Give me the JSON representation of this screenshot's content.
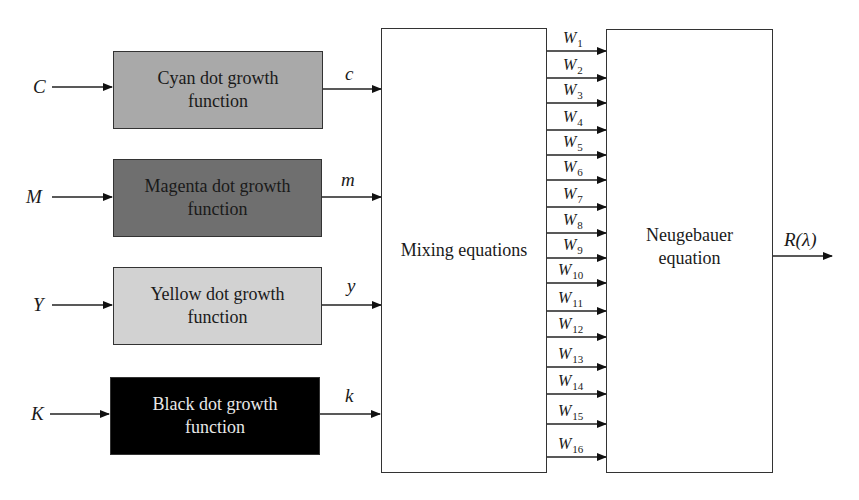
{
  "diagram": {
    "inputs": [
      {
        "label": "C",
        "block": "Cyan dot growth function",
        "output": "c",
        "fill": "#a9a9a9",
        "text_color": "#1a1a1a"
      },
      {
        "label": "M",
        "block": "Magenta dot growth function",
        "output": "m",
        "fill": "#6f6f6f",
        "text_color": "#1a1a1a"
      },
      {
        "label": "Y",
        "block": "Yellow dot growth function",
        "output": "y",
        "fill": "#d2d2d2",
        "text_color": "#1a1a1a"
      },
      {
        "label": "K",
        "block": "Black dot growth function",
        "output": "k",
        "fill": "#000000",
        "text_color": "#e8e8e8"
      }
    ],
    "mixing_block": "Mixing equations",
    "weights": {
      "symbol": "W",
      "subscripts": [
        "1",
        "2",
        "3",
        "4",
        "5",
        "6",
        "7",
        "8",
        "9",
        "10",
        "11",
        "12",
        "13",
        "14",
        "15",
        "16"
      ]
    },
    "neugebauer_block": {
      "line1": "Neugebauer",
      "line2": "equation"
    },
    "output_label": "R(λ)"
  }
}
